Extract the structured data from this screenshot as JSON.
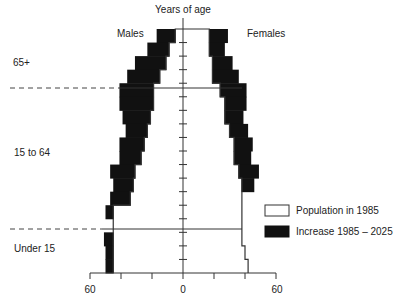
{
  "chart_data": {
    "type": "bar",
    "subtype": "population-pyramid",
    "title": "Years of age",
    "left_label": "Males",
    "right_label": "Females",
    "x_ticks_labels": [
      "60",
      "0",
      "60"
    ],
    "x_range": [
      -60,
      60
    ],
    "x_tick_step": 20,
    "age_group_labels": [
      "65+",
      "15 to 64",
      "Under 15"
    ],
    "age_bands_top_to_bottom": [
      "85+",
      "80-84",
      "75-79",
      "70-74",
      "65-69",
      "60-64",
      "55-59",
      "50-54",
      "45-49",
      "40-44",
      "35-39",
      "30-34",
      "25-29",
      "20-24",
      "15-19",
      "10-14",
      "5-9",
      "0-4"
    ],
    "series": [
      {
        "name": "Population in 1985",
        "color": "#ffffff",
        "males": [
          5,
          9,
          11,
          15,
          19,
          19,
          21,
          23,
          25,
          27,
          31,
          32,
          34,
          45,
          45,
          45,
          45,
          45
        ],
        "females": [
          17,
          17,
          19,
          19,
          24,
          27,
          27,
          30,
          33,
          33,
          36,
          38,
          38,
          38,
          38,
          38,
          40,
          42
        ]
      },
      {
        "name": "Increase 1985 – 2025",
        "color": "#111111",
        "males": [
          12,
          14,
          20,
          21,
          22,
          22,
          18,
          14,
          16,
          14,
          16,
          13,
          13,
          5,
          0,
          6,
          5,
          5
        ],
        "females": [
          12,
          10,
          13,
          17,
          17,
          14,
          12,
          12,
          12,
          11,
          13,
          8,
          0,
          0,
          0,
          0,
          0,
          0
        ]
      }
    ],
    "legend": {
      "position": "right",
      "entries": [
        "Population in 1985",
        "Increase 1985 – 2025"
      ]
    },
    "grid": false
  }
}
